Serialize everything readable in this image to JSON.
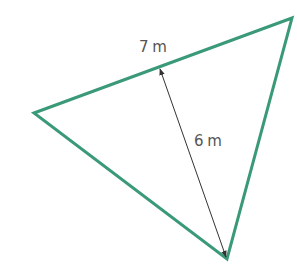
{
  "diagram": {
    "shape": "triangle",
    "stroke_color": "#3a9a78",
    "arrow_color": "#333333",
    "vertices": [
      [
        34,
        113
      ],
      [
        292,
        18
      ],
      [
        227,
        259
      ]
    ],
    "base_label": "7 m",
    "height_label": "6 m"
  }
}
